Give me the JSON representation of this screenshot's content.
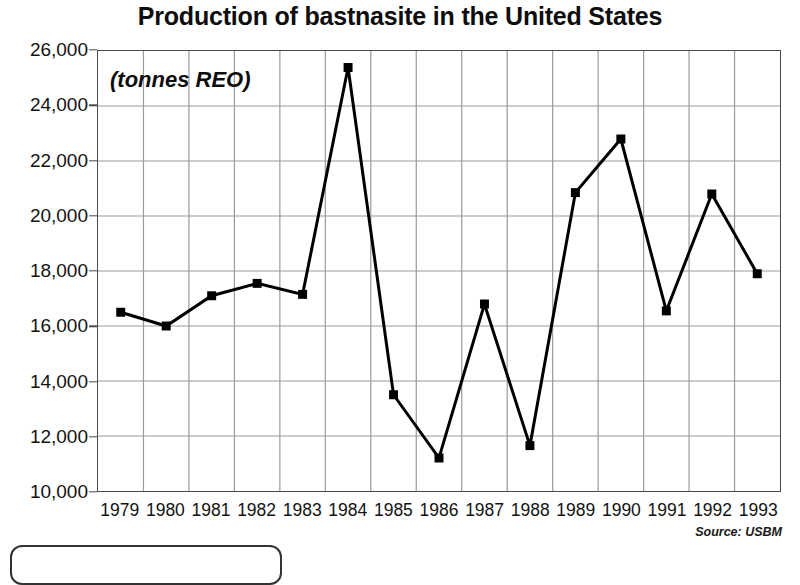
{
  "chart_data": {
    "type": "line",
    "title": "Production of bastnasite in the United States",
    "subtitle": "",
    "annotation": "(tonnes REO)",
    "source": "Source: USBM",
    "xlabel": "",
    "ylabel": "",
    "categories": [
      "1979",
      "1980",
      "1981",
      "1982",
      "1983",
      "1984",
      "1985",
      "1986",
      "1987",
      "1988",
      "1989",
      "1990",
      "1991",
      "1992",
      "1993"
    ],
    "values": [
      16500,
      16000,
      17100,
      17550,
      17150,
      25400,
      13500,
      11200,
      16800,
      11650,
      20850,
      22800,
      16550,
      20800,
      17900
    ],
    "ylim": [
      10000,
      26000
    ],
    "ytick_values": [
      26000,
      24000,
      22000,
      20000,
      18000,
      16000,
      14000,
      12000,
      10000
    ],
    "ytick_labels": [
      "26,000",
      "24,000",
      "22,000",
      "20,000",
      "18,000",
      "16,000",
      "14,000",
      "12,000",
      "10,000"
    ],
    "grid": true,
    "grid_color": "#9a9a9a",
    "legend": "none",
    "series_color": "#000000",
    "marker": "square",
    "line_width": 3
  }
}
